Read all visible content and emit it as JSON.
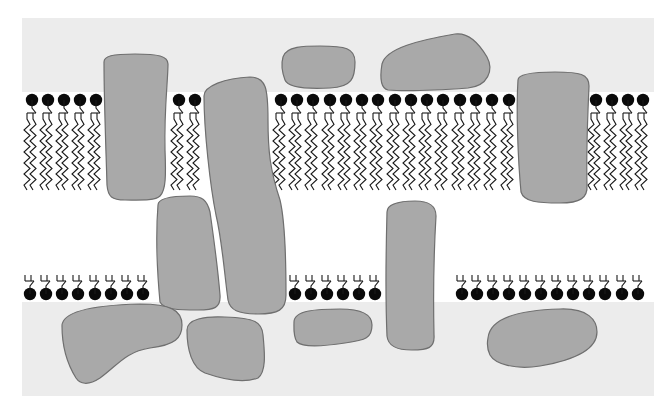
{
  "title": "Fluid mosaic model of the cell membrane",
  "colors": {
    "page_background": "#ffffff",
    "extracellular_panel": "#ececec",
    "bilayer_core": "#ffffff",
    "protein_fill": "#a9a9a9",
    "protein_outline": "#6f6f6f",
    "lipid_head": "#0a0a0a",
    "lipid_tail": "#1a1a1a"
  },
  "panel": {
    "x": 22,
    "y": 18,
    "width": 632,
    "height": 378
  },
  "bilayer": {
    "y_top": 92,
    "y_bottom": 302,
    "gap_top": 192,
    "gap_bottom": 204
  },
  "upper_leaflet": {
    "head_y": 100,
    "tail_start_y": 114,
    "tail_end_y": 190,
    "groups": [
      {
        "name": "upper-left",
        "heads_x": [
          32,
          48,
          64,
          80,
          96
        ]
      },
      {
        "name": "upper-mid-left",
        "heads_x": [
          179,
          195
        ]
      },
      {
        "name": "upper-center",
        "heads_x": [
          281,
          297,
          313,
          330,
          346,
          362,
          378,
          395,
          411,
          427,
          443,
          460,
          476,
          492,
          509
        ]
      },
      {
        "name": "upper-right",
        "heads_x": [
          596,
          612,
          628,
          643
        ]
      }
    ]
  },
  "lower_leaflet": {
    "head_y": 294,
    "tail_start_y": 206,
    "tail_end_y": 280,
    "groups": [
      {
        "name": "lower-left",
        "heads_x": [
          30,
          46,
          62,
          78,
          95,
          111,
          127,
          143
        ]
      },
      {
        "name": "lower-center-left",
        "heads_x": [
          295,
          311,
          327,
          343,
          359,
          375
        ]
      },
      {
        "name": "lower-right",
        "heads_x": [
          462,
          477,
          493,
          509,
          525,
          541,
          557,
          573,
          589,
          605,
          622,
          638
        ]
      }
    ]
  },
  "proteins": [
    {
      "name": "integral-protein-1",
      "type": "integral",
      "d": "M104,62 C104,56 112,54 135,54 C158,54 168,56 168,64 C168,80 164,110 165,150 C166,175 166,190 160,196 C155,201 140,200 125,200 C112,200 108,197 107,185 C106,150 104,100 104,62 Z"
    },
    {
      "name": "integral-protein-2",
      "type": "integral",
      "d": "M204,96 C204,86 225,78 250,77 C266,77 268,88 268,120 C268,150 270,170 280,200 C286,225 286,270 286,295 C286,310 278,314 258,314 C238,314 230,310 228,300 C224,270 222,240 216,215 C210,185 204,130 204,96 Z"
    },
    {
      "name": "integral-protein-3",
      "type": "integral",
      "d": "M158,205 C158,198 172,196 190,196 C202,196 207,200 210,212 C214,240 218,270 220,295 C221,308 214,310 198,310 C180,310 164,310 160,302 C157,270 156,230 158,205 Z"
    },
    {
      "name": "integral-protein-4",
      "type": "integral",
      "d": "M387,212 C387,204 400,201 415,201 C430,201 436,206 436,216 C434,250 433,290 434,335 C435,348 428,350 412,350 C396,350 388,346 387,336 C385,290 386,250 387,212 Z"
    },
    {
      "name": "integral-protein-5",
      "type": "integral",
      "d": "M518,80 C518,74 535,72 555,72 C580,72 589,74 589,86 C588,110 586,150 587,185 C588,198 580,203 560,203 C538,203 524,202 521,192 C518,160 516,110 518,80 Z"
    },
    {
      "name": "peripheral-protein-top-1",
      "type": "peripheral",
      "d": "M283,57 C286,46 305,46 320,46 C345,46 355,48 355,62 C355,78 352,87 330,88 C310,89 288,88 285,80 C282,72 281,64 283,57 Z"
    },
    {
      "name": "peripheral-protein-top-2",
      "type": "peripheral",
      "d": "M382,64 C386,48 420,40 455,34 C470,32 480,45 487,57 C494,70 488,86 468,88 C440,90 410,92 388,90 C380,88 380,76 382,64 Z"
    },
    {
      "name": "peripheral-protein-bottom-1",
      "type": "peripheral",
      "d": "M62,326 C62,310 100,305 140,304 C170,304 182,310 182,325 C182,338 175,345 150,348 C125,352 118,365 100,378 C88,386 80,384 76,378 C66,362 62,344 62,326 Z"
    },
    {
      "name": "peripheral-protein-bottom-2",
      "type": "peripheral",
      "d": "M187,330 C187,319 205,316 225,317 C255,318 262,322 263,335 C265,355 266,372 258,378 C245,383 225,380 205,373 C192,368 187,350 187,330 Z"
    },
    {
      "name": "peripheral-protein-bottom-3",
      "type": "peripheral",
      "d": "M294,322 C294,310 318,309 340,309 C362,309 372,314 372,325 C372,338 366,340 345,343 C325,346 303,348 297,342 C293,336 294,328 294,322 Z"
    },
    {
      "name": "peripheral-protein-bottom-4",
      "type": "peripheral",
      "d": "M488,338 C490,318 520,310 560,309 C588,308 597,320 597,332 C597,350 575,360 540,366 C515,370 495,364 490,355 C487,349 487,343 488,338 Z"
    }
  ],
  "labels": {
    "upper_leaflet": "Outer lipid leaflet",
    "lower_leaflet": "Inner lipid leaflet",
    "integral": "Integral protein",
    "peripheral": "Peripheral protein"
  }
}
